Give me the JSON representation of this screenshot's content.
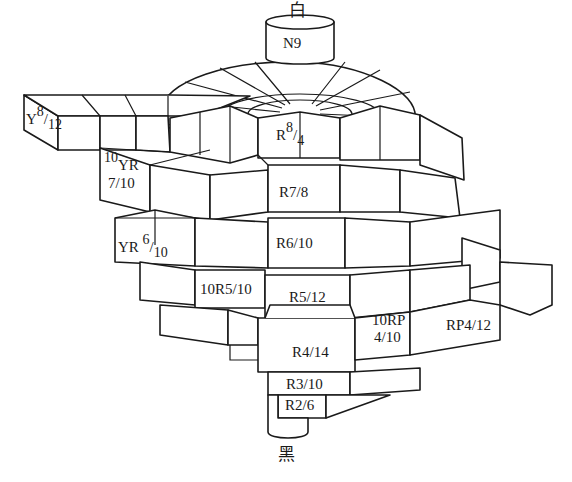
{
  "diagram": {
    "type": "munsell-color-solid",
    "colors": {
      "line": "#1a1a1a",
      "fill": "#ffffff",
      "background": "#ffffff"
    },
    "axis": {
      "top_label": "白",
      "bottom_label": "黑",
      "neutral_label": "N9"
    },
    "chips": [
      {
        "id": "y-8-12",
        "hue": "Y",
        "value": "8",
        "chroma": "12"
      },
      {
        "id": "r-8-4",
        "hue": "R",
        "value": "8",
        "chroma": "4"
      },
      {
        "id": "10yr-7-10",
        "hue_num": "10",
        "hue": "YR",
        "value_chroma": "7/10"
      },
      {
        "id": "yr-6-10",
        "hue": "YR",
        "value": "6",
        "chroma": "10"
      },
      {
        "id": "r-7-8",
        "label": "R7/8"
      },
      {
        "id": "r-6-10",
        "label": "R6/10"
      },
      {
        "id": "10r-5-10",
        "label": "10R5/10"
      },
      {
        "id": "r-5-12",
        "label": "R5/12"
      },
      {
        "id": "10rp-4-10",
        "line1": "10RP",
        "line2": "4/10"
      },
      {
        "id": "rp-4-12",
        "label": "RP4/12"
      },
      {
        "id": "r-4-14",
        "label": "R4/14"
      },
      {
        "id": "r-3-10",
        "label": "R3/10"
      },
      {
        "id": "r-2-6",
        "label": "R2/6"
      }
    ]
  }
}
